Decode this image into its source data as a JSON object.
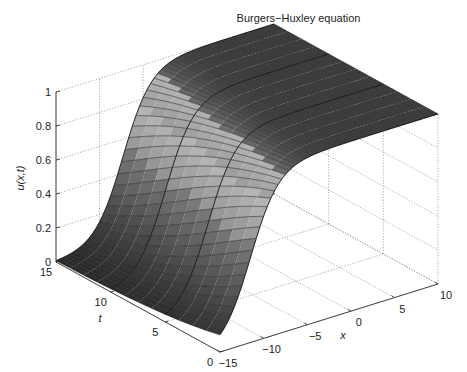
{
  "chart_data": {
    "type": "surface3d",
    "title": "Burgers−Huxley equation",
    "xlabel": "x",
    "ylabel": "t",
    "zlabel": "u(x,t)",
    "xlim": [
      -15,
      10
    ],
    "ylim": [
      0,
      15
    ],
    "zlim": [
      0,
      1
    ],
    "x_ticks": [
      "−15",
      "−10",
      "−5",
      "0",
      "5",
      "10"
    ],
    "x_tick_values": [
      -15,
      -10,
      -5,
      0,
      5,
      10
    ],
    "t_ticks": [
      "0",
      "5",
      "10",
      "15"
    ],
    "t_tick_values": [
      0,
      5,
      10,
      15
    ],
    "z_ticks": [
      "0",
      "0.2",
      "0.4",
      "0.6",
      "0.8",
      "1"
    ],
    "z_tick_values": [
      0,
      0.2,
      0.4,
      0.6,
      0.8,
      1
    ],
    "grid": true,
    "colormap": "gray",
    "surface_model": {
      "description": "Traveling-wave kink solution rising from 0 to 1 in x; front center moves slowly to the right with t",
      "front_center_at_t0": -11.5,
      "front_speed": 0.28,
      "front_width": 1.6
    },
    "sample_profile_t0": {
      "x": [
        -15,
        -13.6,
        -11.5,
        -9,
        -5.8,
        0,
        10
      ],
      "u": [
        0.1,
        0.21,
        0.5,
        0.83,
        0.97,
        1.0,
        1.0
      ]
    },
    "sample_profile_t15": {
      "x": [
        -15,
        -10,
        -7.3,
        -5,
        -3,
        0,
        10
      ],
      "u": [
        0.01,
        0.15,
        0.5,
        0.81,
        0.93,
        0.99,
        1.0
      ]
    },
    "mesh": {
      "x_count": 60,
      "t_count": 4
    }
  },
  "labels": {
    "title": "Burgers−Huxley equation",
    "zlabel": "u(x,t)",
    "tlabel": "t",
    "xlabel": "x"
  }
}
